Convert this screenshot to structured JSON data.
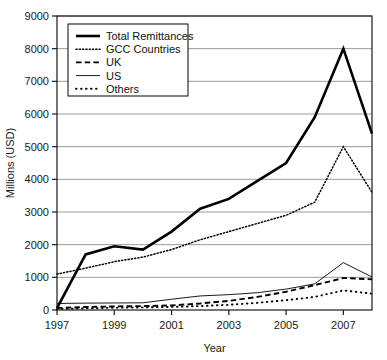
{
  "chart_data": {
    "type": "line",
    "title": "",
    "xlabel": "Year",
    "ylabel": "Millions (USD)",
    "x": [
      1997,
      1998,
      1999,
      2000,
      2001,
      2002,
      2003,
      2004,
      2005,
      2006,
      2007,
      2008
    ],
    "xlim": [
      1997,
      2008
    ],
    "ylim": [
      0,
      9000
    ],
    "ytick_labels": [
      "0",
      "1000",
      "2000",
      "3000",
      "4000",
      "5000",
      "6000",
      "7000",
      "8000",
      "9000"
    ],
    "yticks": [
      0,
      1000,
      2000,
      3000,
      4000,
      5000,
      6000,
      7000,
      8000,
      9000
    ],
    "xtick_labels": [
      "1997",
      "1999",
      "2001",
      "2003",
      "2005",
      "2007"
    ],
    "xticks": [
      1997,
      1999,
      2001,
      2003,
      2005,
      2007
    ],
    "grid": "horizontal",
    "legend_position": "top-left-inside",
    "series": [
      {
        "name": "Total Remittances",
        "style": "thick-solid",
        "values": [
          60,
          1700,
          1950,
          1850,
          2400,
          3100,
          3400,
          3950,
          4500,
          5900,
          8000,
          5400
        ]
      },
      {
        "name": "GCC Countries",
        "style": "fine-dotted",
        "values": [
          1100,
          1280,
          1480,
          1620,
          1850,
          2150,
          2400,
          2650,
          2900,
          3300,
          5000,
          3600
        ]
      },
      {
        "name": "UK",
        "style": "dashed",
        "values": [
          60,
          90,
          110,
          120,
          140,
          200,
          280,
          400,
          560,
          760,
          980,
          940
        ]
      },
      {
        "name": "US",
        "style": "thin-solid",
        "values": [
          200,
          210,
          215,
          220,
          330,
          430,
          470,
          530,
          640,
          800,
          1450,
          1010
        ]
      },
      {
        "name": "Others",
        "style": "sparse-dotted",
        "values": [
          30,
          50,
          70,
          80,
          95,
          120,
          160,
          220,
          300,
          400,
          600,
          500
        ]
      }
    ]
  }
}
